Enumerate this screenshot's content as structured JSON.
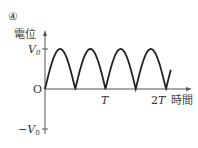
{
  "figure_label": "④",
  "chart_data": {
    "type": "line",
    "title": "",
    "ylabel": "電位",
    "xlabel": "時間",
    "y_ticks": [
      {
        "label": "V₀",
        "value": 1
      },
      {
        "label": "O",
        "value": 0
      },
      {
        "label": "−V₀",
        "value": -1
      }
    ],
    "x_ticks": [
      {
        "label": "T",
        "value": 1
      },
      {
        "label": "2T",
        "value": 2
      }
    ],
    "ylim": [
      -1,
      1
    ],
    "xlim": [
      0,
      2.1
    ],
    "series": [
      {
        "name": "電位",
        "function": "V0*|sin(2*pi*t/T)|",
        "x": [
          0,
          0.25,
          0.5,
          0.75,
          1.0,
          1.25,
          1.5,
          1.75,
          2.0,
          2.08
        ],
        "values": [
          0,
          1,
          0,
          1,
          0,
          1,
          0,
          1,
          0,
          0.48
        ]
      }
    ],
    "grid": false,
    "legend": "none"
  },
  "labels": {
    "ylabel": "電位",
    "xlabel": "時間",
    "v0": "V",
    "v0_sub": "0",
    "origin": "O",
    "neg_v0_sign": "−",
    "neg_v0": "V",
    "neg_v0_sub": "0",
    "t1": "T",
    "t2_coef": "2",
    "t2": "T"
  }
}
